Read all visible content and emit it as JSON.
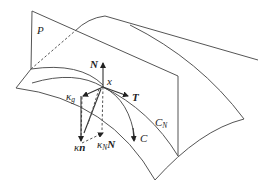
{
  "diagram": {
    "labels": {
      "plane": "P",
      "normal": "N",
      "point": "x",
      "tangent": "T",
      "geodesic_curvature_kappa": "κ",
      "geodesic_curvature_sub": "g",
      "curvature_vector_kappa": "κ",
      "curvature_vector_n": "n",
      "normal_curvature_kappa": "κ",
      "normal_curvature_sub": "N",
      "normal_curvature_N": "N",
      "curve": "C",
      "normal_section_curve": "C",
      "normal_section_sub": "N"
    },
    "colors": {
      "lines": "#555555",
      "vectors": "#333333",
      "text": "#222222",
      "background": "#ffffff"
    }
  }
}
